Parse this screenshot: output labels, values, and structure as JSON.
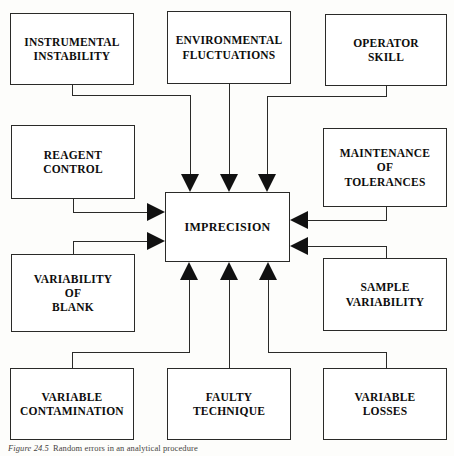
{
  "figure": {
    "title": "IMPRECISION",
    "caption_label": "Figure 24.5",
    "caption_text": "Random errors in an analytical procedure"
  },
  "colors": {
    "line": "#2a2a28",
    "arrow_fill": "#111111",
    "box_border": "#2a2a28",
    "box_fill": "#ffffff",
    "text": "#0d0d0c",
    "page_background": "#fdfdfb"
  },
  "center": {
    "label": "IMPRECISION",
    "x": 165,
    "y": 192,
    "w": 125,
    "h": 70
  },
  "nodes": [
    {
      "id": "instrumental-instability",
      "label": "INSTRUMENTAL\nINSTABILITY",
      "position": "top-left",
      "x": 10,
      "y": 13,
      "w": 124,
      "h": 72
    },
    {
      "id": "environmental-fluctuations",
      "label": "ENVIRONMENTAL\nFLUCTUATIONS",
      "position": "top-center",
      "x": 167,
      "y": 11,
      "w": 124,
      "h": 73
    },
    {
      "id": "operator-skill",
      "label": "OPERATOR\nSKILL",
      "position": "top-right",
      "x": 325,
      "y": 14,
      "w": 122,
      "h": 72
    },
    {
      "id": "reagent-control",
      "label": "REAGENT\nCONTROL",
      "position": "middle-left-upper",
      "x": 11,
      "y": 125,
      "w": 124,
      "h": 74
    },
    {
      "id": "maintenance-of-tolerances",
      "label": "MAINTENANCE\nOF\nTOLERANCES",
      "position": "middle-right-upper",
      "x": 323,
      "y": 128,
      "w": 124,
      "h": 79
    },
    {
      "id": "variability-of-blank",
      "label": "VARIABILITY\nOF\nBLANK",
      "position": "middle-left-lower",
      "x": 11,
      "y": 254,
      "w": 124,
      "h": 78
    },
    {
      "id": "sample-variability",
      "label": "SAMPLE\nVARIABILITY",
      "position": "middle-right-lower",
      "x": 323,
      "y": 258,
      "w": 124,
      "h": 73
    },
    {
      "id": "variable-contamination",
      "label": "VARIABLE\nCONTAMINATION",
      "position": "bottom-left",
      "x": 10,
      "y": 368,
      "w": 124,
      "h": 72
    },
    {
      "id": "faulty-technique",
      "label": "FAULTY\nTECHNIQUE",
      "position": "bottom-center",
      "x": 167,
      "y": 368,
      "w": 124,
      "h": 72
    },
    {
      "id": "variable-losses",
      "label": "VARIABLE\nLOSSES",
      "position": "bottom-right",
      "x": 323,
      "y": 368,
      "w": 124,
      "h": 72
    }
  ],
  "connectors": [
    {
      "from": "instrumental-instability",
      "to": "center",
      "enters": "top",
      "arrow": "down"
    },
    {
      "from": "environmental-fluctuations",
      "to": "center",
      "enters": "top",
      "arrow": "down"
    },
    {
      "from": "operator-skill",
      "to": "center",
      "enters": "top",
      "arrow": "down"
    },
    {
      "from": "reagent-control",
      "to": "center",
      "enters": "left",
      "arrow": "right"
    },
    {
      "from": "variability-of-blank",
      "to": "center",
      "enters": "left",
      "arrow": "right"
    },
    {
      "from": "maintenance-of-tolerances",
      "to": "center",
      "enters": "right",
      "arrow": "left"
    },
    {
      "from": "sample-variability",
      "to": "center",
      "enters": "right",
      "arrow": "left"
    },
    {
      "from": "variable-contamination",
      "to": "center",
      "enters": "bottom",
      "arrow": "up"
    },
    {
      "from": "faulty-technique",
      "to": "center",
      "enters": "bottom",
      "arrow": "up"
    },
    {
      "from": "variable-losses",
      "to": "center",
      "enters": "bottom",
      "arrow": "up"
    }
  ]
}
